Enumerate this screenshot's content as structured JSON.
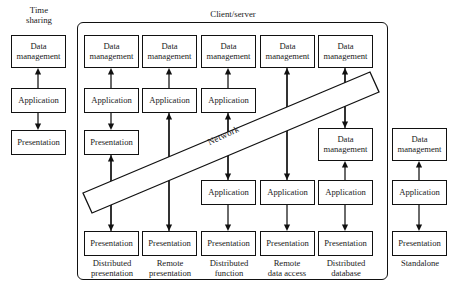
{
  "diagram": {
    "title_timesharing": "Time\nsharing",
    "title_clientserver": "Client/server",
    "network_label": "Network",
    "labels": {
      "data_management": "Data\nmanagement",
      "application": "Application",
      "presentation": "Presentation"
    },
    "columns": [
      {
        "id": "time-sharing",
        "caption": "",
        "header": "Time sharing",
        "in_group": false,
        "layers": [
          "Data management",
          "Application",
          "Presentation"
        ]
      },
      {
        "id": "distributed-presentation",
        "caption": "Distributed\npresentation",
        "in_group": true,
        "layers": [
          "Data management",
          "Application",
          "Presentation",
          "Presentation"
        ]
      },
      {
        "id": "remote-presentation",
        "caption": "Remote\npresentation",
        "in_group": true,
        "layers": [
          "Data management",
          "Application",
          "Presentation"
        ]
      },
      {
        "id": "distributed-function",
        "caption": "Distributed\nfunction",
        "in_group": true,
        "layers": [
          "Data management",
          "Application",
          "Application",
          "Presentation"
        ]
      },
      {
        "id": "remote-data-access",
        "caption": "Remote\ndata access",
        "in_group": true,
        "layers": [
          "Data management",
          "Application",
          "Presentation"
        ]
      },
      {
        "id": "distributed-database",
        "caption": "Distributed\ndatabase",
        "in_group": true,
        "layers": [
          "Data management",
          "Data management",
          "Application",
          "Presentation"
        ]
      },
      {
        "id": "standalone",
        "caption": "Standalone",
        "in_group": false,
        "layers": [
          "Data management",
          "Application",
          "Presentation"
        ]
      }
    ],
    "boxes": [
      {
        "name": "box-timesharing-data-management",
        "text": "Data\nmanagement",
        "x": 11,
        "y": 35,
        "w": 55,
        "h": 33
      },
      {
        "name": "box-timesharing-application",
        "text": "Application",
        "x": 11,
        "y": 88,
        "w": 55,
        "h": 25
      },
      {
        "name": "box-timesharing-presentation",
        "text": "Presentation",
        "x": 11,
        "y": 130,
        "w": 55,
        "h": 25
      },
      {
        "name": "box-distpres-data-management",
        "text": "Data\nmanagement",
        "x": 84,
        "y": 35,
        "w": 55,
        "h": 33
      },
      {
        "name": "box-distpres-application",
        "text": "Application",
        "x": 84,
        "y": 88,
        "w": 55,
        "h": 25
      },
      {
        "name": "box-distpres-presentation-server",
        "text": "Presentation",
        "x": 84,
        "y": 130,
        "w": 55,
        "h": 25
      },
      {
        "name": "box-distpres-presentation-client",
        "text": "Presentation",
        "x": 84,
        "y": 231,
        "w": 55,
        "h": 25
      },
      {
        "name": "box-rempres-data-management",
        "text": "Data\nmanagement",
        "x": 142,
        "y": 35,
        "w": 55,
        "h": 33
      },
      {
        "name": "box-rempres-application",
        "text": "Application",
        "x": 142,
        "y": 88,
        "w": 55,
        "h": 25
      },
      {
        "name": "box-rempres-presentation",
        "text": "Presentation",
        "x": 142,
        "y": 231,
        "w": 55,
        "h": 25
      },
      {
        "name": "box-distfunc-data-management",
        "text": "Data\nmanagement",
        "x": 201,
        "y": 35,
        "w": 55,
        "h": 33
      },
      {
        "name": "box-distfunc-application-server",
        "text": "Application",
        "x": 201,
        "y": 88,
        "w": 55,
        "h": 25
      },
      {
        "name": "box-distfunc-application-client",
        "text": "Application",
        "x": 201,
        "y": 180,
        "w": 55,
        "h": 25
      },
      {
        "name": "box-distfunc-presentation",
        "text": "Presentation",
        "x": 201,
        "y": 231,
        "w": 55,
        "h": 25
      },
      {
        "name": "box-remdata-data-management",
        "text": "Data\nmanagement",
        "x": 260,
        "y": 35,
        "w": 55,
        "h": 33
      },
      {
        "name": "box-remdata-application",
        "text": "Application",
        "x": 260,
        "y": 180,
        "w": 55,
        "h": 25
      },
      {
        "name": "box-remdata-presentation",
        "text": "Presentation",
        "x": 260,
        "y": 231,
        "w": 55,
        "h": 25
      },
      {
        "name": "box-distdb-data-management-server",
        "text": "Data\nmanagement",
        "x": 318,
        "y": 35,
        "w": 55,
        "h": 33
      },
      {
        "name": "box-distdb-data-management-client",
        "text": "Data\nmanagement",
        "x": 318,
        "y": 128,
        "w": 55,
        "h": 33
      },
      {
        "name": "box-distdb-application",
        "text": "Application",
        "x": 318,
        "y": 180,
        "w": 55,
        "h": 25
      },
      {
        "name": "box-distdb-presentation",
        "text": "Presentation",
        "x": 318,
        "y": 231,
        "w": 55,
        "h": 25
      },
      {
        "name": "box-standalone-data-management",
        "text": "Data\nmanagement",
        "x": 392,
        "y": 128,
        "w": 55,
        "h": 33
      },
      {
        "name": "box-standalone-application",
        "text": "Application",
        "x": 392,
        "y": 180,
        "w": 55,
        "h": 25
      },
      {
        "name": "box-standalone-presentation",
        "text": "Presentation",
        "x": 392,
        "y": 231,
        "w": 55,
        "h": 25
      }
    ],
    "captions": [
      {
        "name": "caption-distributed-presentation",
        "text": "Distributed\npresentation",
        "x": 82,
        "y": 259,
        "w": 60
      },
      {
        "name": "caption-remote-presentation",
        "text": "Remote\npresentation",
        "x": 140,
        "y": 259,
        "w": 60
      },
      {
        "name": "caption-distributed-function",
        "text": "Distributed\nfunction",
        "x": 199,
        "y": 259,
        "w": 60
      },
      {
        "name": "caption-remote-data-access",
        "text": "Remote\ndata access",
        "x": 257,
        "y": 259,
        "w": 60
      },
      {
        "name": "caption-distributed-database",
        "text": "Distributed\ndatabase",
        "x": 316,
        "y": 259,
        "w": 60
      },
      {
        "name": "caption-standalone",
        "text": "Standalone",
        "x": 390,
        "y": 259,
        "w": 60
      }
    ],
    "arrows": [
      {
        "name": "arrow-timesharing-app-to-dm",
        "x": 38,
        "y1": 88,
        "y2": 68,
        "dir": "up"
      },
      {
        "name": "arrow-timesharing-app-to-pres",
        "x": 38,
        "y1": 113,
        "y2": 130,
        "dir": "down"
      },
      {
        "name": "arrow-distpres-app-to-dm",
        "x": 111,
        "y1": 88,
        "y2": 68,
        "dir": "up"
      },
      {
        "name": "arrow-distpres-app-to-pres",
        "x": 111,
        "y1": 113,
        "y2": 130,
        "dir": "down"
      },
      {
        "name": "arrow-distpres-presclient-up",
        "x": 111,
        "y1": 231,
        "y2": 155,
        "dir": "up"
      },
      {
        "name": "arrow-distpres-presclient-down",
        "x": 111,
        "y1": 155,
        "y2": 231,
        "dir": "down"
      },
      {
        "name": "arrow-rempres-app-to-dm",
        "x": 169,
        "y1": 88,
        "y2": 68,
        "dir": "up"
      },
      {
        "name": "arrow-rempres-pres-to-app",
        "x": 169,
        "y1": 231,
        "y2": 113,
        "dir": "up"
      },
      {
        "name": "arrow-rempres-app-to-pres",
        "x": 169,
        "y1": 113,
        "y2": 231,
        "dir": "down"
      },
      {
        "name": "arrow-distfunc-app-to-dm",
        "x": 228,
        "y1": 88,
        "y2": 68,
        "dir": "up"
      },
      {
        "name": "arrow-distfunc-appclient-to-server",
        "x": 228,
        "y1": 180,
        "y2": 113,
        "dir": "up"
      },
      {
        "name": "arrow-distfunc-server-to-appclient",
        "x": 228,
        "y1": 113,
        "y2": 180,
        "dir": "down"
      },
      {
        "name": "arrow-distfunc-app-to-pres",
        "x": 228,
        "y1": 205,
        "y2": 231,
        "dir": "down"
      },
      {
        "name": "arrow-remdata-app-to-dm",
        "x": 287,
        "y1": 180,
        "y2": 68,
        "dir": "up"
      },
      {
        "name": "arrow-remdata-dm-to-app",
        "x": 287,
        "y1": 68,
        "y2": 180,
        "dir": "down"
      },
      {
        "name": "arrow-remdata-app-to-pres",
        "x": 287,
        "y1": 205,
        "y2": 231,
        "dir": "down"
      },
      {
        "name": "arrow-distdb-dmclient-to-dmserver",
        "x": 345,
        "y1": 128,
        "y2": 68,
        "dir": "up"
      },
      {
        "name": "arrow-distdb-dmserver-to-dmclient",
        "x": 345,
        "y1": 68,
        "y2": 128,
        "dir": "down"
      },
      {
        "name": "arrow-distdb-app-to-dm",
        "x": 345,
        "y1": 180,
        "y2": 161,
        "dir": "up"
      },
      {
        "name": "arrow-distdb-app-to-pres",
        "x": 345,
        "y1": 205,
        "y2": 231,
        "dir": "down"
      },
      {
        "name": "arrow-standalone-app-to-dm",
        "x": 419,
        "y1": 180,
        "y2": 161,
        "dir": "up"
      },
      {
        "name": "arrow-standalone-app-to-pres",
        "x": 419,
        "y1": 205,
        "y2": 231,
        "dir": "down"
      }
    ],
    "network_band": {
      "p1x": 83,
      "p1y": 193,
      "p2x": 370,
      "p2y": 72,
      "p3x": 379,
      "p3y": 92,
      "p4x": 92,
      "p4y": 213
    },
    "group_rect": {
      "x": 77,
      "y": 22,
      "w": 311,
      "h": 258
    }
  }
}
